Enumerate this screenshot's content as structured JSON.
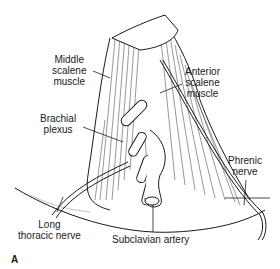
{
  "figure": {
    "panel_letter": "A",
    "colors": {
      "ink": "#1a1a1a",
      "background": "#ffffff"
    },
    "labels": [
      {
        "id": "middle-scalene",
        "lines": [
          "Middle",
          "scalene",
          "muscle"
        ]
      },
      {
        "id": "anterior-scalene",
        "lines": [
          "Anterior",
          "scalene",
          "muscle"
        ]
      },
      {
        "id": "brachial-plexus",
        "lines": [
          "Brachial",
          "plexus"
        ]
      },
      {
        "id": "phrenic-nerve",
        "lines": [
          "Phrenic",
          "nerve"
        ]
      },
      {
        "id": "long-thoracic-nerve",
        "lines": [
          "Long",
          "thoracic nerve"
        ]
      },
      {
        "id": "subclavian-artery",
        "lines": [
          "Subclavian artery"
        ]
      }
    ]
  }
}
